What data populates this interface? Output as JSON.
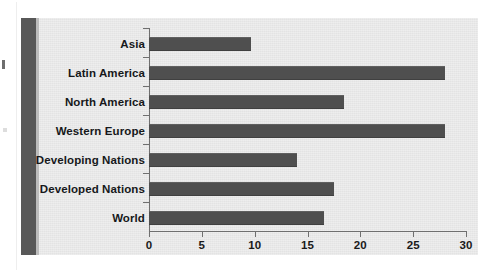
{
  "figure": {
    "background_color": "#ffffff",
    "panel_color": "#e9e9e9",
    "binding_stripe_color": "#585858",
    "bar_color": "#4f4f4f",
    "axis_color": "#6f6f6f",
    "text_color": "#16181a"
  },
  "chart_data": {
    "type": "bar",
    "orientation": "horizontal",
    "title": "",
    "subtitle": "",
    "xlabel": "",
    "ylabel": "",
    "categories": [
      "Asia",
      "Latin America",
      "North America",
      "Western Europe",
      "Developing Nations",
      "Developed Nations",
      "World"
    ],
    "values": [
      9.7,
      28.0,
      18.5,
      28.0,
      14.0,
      17.5,
      16.6
    ],
    "series": [
      {
        "name": "",
        "values": [
          9.7,
          28.0,
          18.5,
          28.0,
          14.0,
          17.5,
          16.6
        ]
      }
    ],
    "xlim": [
      0,
      30
    ],
    "ylim": null,
    "xticks": [
      0,
      5,
      10,
      15,
      20,
      25,
      30
    ],
    "xtick_labels": [
      "0",
      "5",
      "10",
      "15",
      "20",
      "25",
      "30"
    ],
    "grid": false,
    "legend": null,
    "legend_position": "none",
    "annotations": []
  }
}
